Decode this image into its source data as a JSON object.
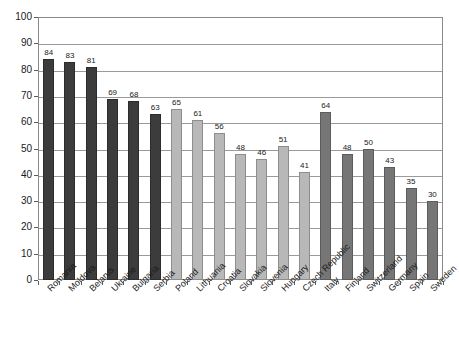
{
  "chart_data": {
    "type": "bar",
    "title": "",
    "subtitle": "",
    "xlabel": "",
    "ylabel": "",
    "ylim": [
      0,
      100
    ],
    "ytick_step": 10,
    "yticks": [
      0,
      10,
      20,
      30,
      40,
      50,
      60,
      70,
      80,
      90,
      100
    ],
    "ytick_labels": [
      "0",
      "10",
      "20",
      "30",
      "40",
      "50",
      "60",
      "70",
      "80",
      "90",
      "100"
    ],
    "grid": true,
    "grid_axis": "y",
    "legend": false,
    "legend_position": "none",
    "data_labels": true,
    "categories": [
      "Romania",
      "Moldova",
      "Belarus",
      "Ukraine",
      "Bulgaria",
      "Serbia",
      "Poland",
      "Lithuania",
      "Croatia",
      "Slovakia",
      "Slovenia",
      "Hungary",
      "Czech Republic",
      "Italy",
      "Finland",
      "Switzerland",
      "Germany",
      "Spain",
      "Sweden"
    ],
    "values": [
      84,
      83,
      81,
      69,
      68,
      63,
      65,
      61,
      56,
      48,
      46,
      51,
      41,
      64,
      48,
      50,
      43,
      35,
      30
    ],
    "bar_groups": [
      "dark",
      "dark",
      "dark",
      "dark",
      "dark",
      "dark",
      "light",
      "light",
      "light",
      "light",
      "light",
      "light",
      "light",
      "medium",
      "medium",
      "medium",
      "medium",
      "medium",
      "medium"
    ],
    "colors": {
      "dark": "#3c3c3c",
      "light": "#b8b8b8",
      "medium": "#767676",
      "gridline": "#9a9a9a",
      "frame": "#8a8a8a",
      "text": "#1a1a1a",
      "background": "#ffffff"
    }
  }
}
